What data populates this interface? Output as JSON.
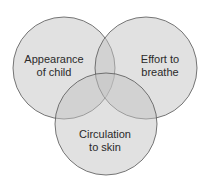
{
  "diagram": {
    "type": "venn",
    "circles": [
      {
        "id": "appearance",
        "label_line1": "Appearance",
        "label_line2": "of child",
        "cx": 64,
        "cy": 68,
        "r": 51,
        "label_x": 54,
        "label_y": 66
      },
      {
        "id": "effort",
        "label_line1": "Effort to",
        "label_line2": "breathe",
        "cx": 146,
        "cy": 68,
        "r": 51,
        "label_x": 160,
        "label_y": 66
      },
      {
        "id": "circulation",
        "label_line1": "Circulation",
        "label_line2": "to skin",
        "cx": 106,
        "cy": 124,
        "r": 51,
        "label_x": 105,
        "label_y": 141
      }
    ],
    "fill": "#bdbdbd",
    "fill_opacity": 0.5,
    "stroke": "#555555"
  }
}
